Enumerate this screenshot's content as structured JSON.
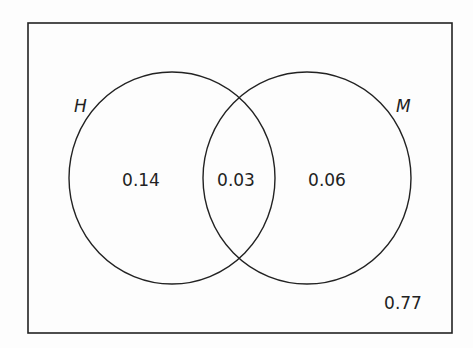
{
  "diagram": {
    "type": "venn",
    "sets": [
      {
        "name": "H",
        "label": "H"
      },
      {
        "name": "M",
        "label": "M"
      }
    ],
    "regions": {
      "h_only": "0.14",
      "h_and_m": "0.03",
      "m_only": "0.06",
      "outside": "0.77"
    },
    "colors": {
      "stroke": "#222222",
      "background": "#fdfdfd"
    }
  }
}
